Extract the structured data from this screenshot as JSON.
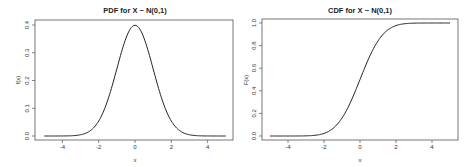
{
  "chart_data": [
    {
      "type": "line",
      "title": "PDF for X ~ N(0,1)",
      "xlabel": "x",
      "ylabel": "f(x)",
      "xlim": [
        -5,
        5
      ],
      "ylim": [
        0,
        0.4
      ],
      "xticks": [
        -4,
        -2,
        0,
        2,
        4
      ],
      "yticks": [
        0.0,
        0.1,
        0.2,
        0.3,
        0.4
      ],
      "xtick_labels": [
        "-4",
        "-2",
        "0",
        "2",
        "4"
      ],
      "ytick_labels": [
        "0.0",
        "0.1",
        "0.2",
        "0.3",
        "0.4"
      ],
      "grid": false,
      "series": [
        {
          "name": "dnorm",
          "function": "normal_pdf",
          "mean": 0,
          "sd": 1,
          "x": [
            -5,
            -4,
            -3,
            -2.5,
            -2,
            -1.5,
            -1,
            -0.5,
            0,
            0.5,
            1,
            1.5,
            2,
            2.5,
            3,
            4,
            5
          ],
          "values": [
            0.0,
            0.0001,
            0.0044,
            0.0175,
            0.054,
            0.1295,
            0.242,
            0.3521,
            0.3989,
            0.3521,
            0.242,
            0.1295,
            0.054,
            0.0175,
            0.0044,
            0.0001,
            0.0
          ]
        }
      ]
    },
    {
      "type": "line",
      "title": "CDF for X ~ N(0,1)",
      "xlabel": "x",
      "ylabel": "F(x)",
      "xlim": [
        -5,
        5
      ],
      "ylim": [
        0,
        1
      ],
      "xticks": [
        -4,
        -2,
        0,
        2,
        4
      ],
      "yticks": [
        0.0,
        0.2,
        0.4,
        0.6,
        0.8,
        1.0
      ],
      "xtick_labels": [
        "-4",
        "-2",
        "0",
        "2",
        "4"
      ],
      "ytick_labels": [
        "0.0",
        "0.2",
        "0.4",
        "0.6",
        "0.8",
        "1.0"
      ],
      "grid": false,
      "series": [
        {
          "name": "pnorm",
          "function": "normal_cdf",
          "mean": 0,
          "sd": 1,
          "x": [
            -5,
            -4,
            -3,
            -2.5,
            -2,
            -1.5,
            -1,
            -0.5,
            0,
            0.5,
            1,
            1.5,
            2,
            2.5,
            3,
            4,
            5
          ],
          "values": [
            0.0,
            0.0,
            0.0013,
            0.0062,
            0.0228,
            0.0668,
            0.1587,
            0.3085,
            0.5,
            0.6915,
            0.8413,
            0.9332,
            0.9772,
            0.9938,
            0.9987,
            1.0,
            1.0
          ]
        }
      ]
    }
  ]
}
